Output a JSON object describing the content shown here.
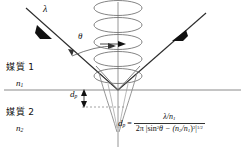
{
  "figure": {
    "colors": {
      "ray": "#2b2b2b",
      "helix": "#6e6e6e",
      "interface": "#8a8a8a",
      "axis": "#8a8a8a",
      "decay": "#8a8a8a",
      "text": "#111111",
      "dashed": "#8a8a8a"
    }
  },
  "labels": {
    "medium1": "媒質 1",
    "medium1_index": "n",
    "medium1_index_sub": "1",
    "medium2": "媒質 2",
    "medium2_index": "n",
    "medium2_index_sub": "2",
    "wavelength": "λ",
    "angle": "θ",
    "penetration_depth": "d",
    "penetration_depth_sub": "p"
  },
  "formula": {
    "lhs": "d",
    "lhs_sub": "p",
    "equals": "=",
    "numerator": "λ/n",
    "numerator_sub": "1",
    "denominator_prefix": "2π |sin",
    "denominator_sin_exp": "2",
    "denominator_theta": "θ − (n",
    "denominator_n2_sub": "2",
    "denominator_slash": "/n",
    "denominator_n1_sub": "1",
    "denominator_close": ")",
    "denominator_sq_exp": "2",
    "denominator_bar": "|",
    "denominator_power": "1/2"
  },
  "geometry": {
    "interface_y": 90,
    "vertex_x": 118,
    "axis_x": 118,
    "helix_turns": 5,
    "incident_arrow": "down-right",
    "reflected_arrow": "up-right"
  }
}
